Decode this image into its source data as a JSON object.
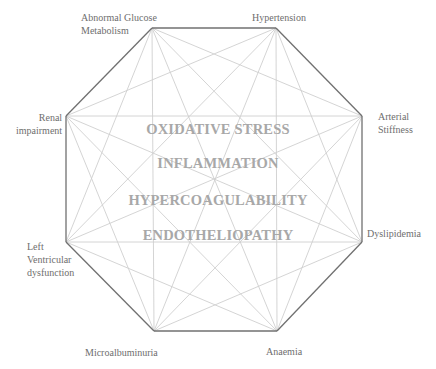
{
  "diagram": {
    "type": "complete-graph-octagon",
    "colors": {
      "edge": "#707070",
      "diagonal": "#cfcfcf",
      "node_label": "#6e6e6e",
      "center_label": "#a8a8a8"
    },
    "nodes": [
      {
        "id": "abnormal-glucose-metabolism",
        "label": "Abnormal Glucose\nMetabolism",
        "x": 152,
        "y": 28
      },
      {
        "id": "hypertension",
        "label": "Hypertension",
        "x": 276,
        "y": 28
      },
      {
        "id": "arterial-stiffness",
        "label": "Arterial\nStiffness",
        "x": 362,
        "y": 116
      },
      {
        "id": "dyslipidemia",
        "label": "Dyslipidemia",
        "x": 362,
        "y": 242
      },
      {
        "id": "anaemia",
        "label": "Anaemia",
        "x": 277,
        "y": 331
      },
      {
        "id": "microalbuminuria",
        "label": "Microalbuminuria",
        "x": 154,
        "y": 331
      },
      {
        "id": "left-ventricular-dysfunction",
        "label": "Left\nVentricular\ndysfunction",
        "x": 66,
        "y": 242
      },
      {
        "id": "renal-impairment",
        "label": "Renal\nimpairment",
        "x": 66,
        "y": 116
      }
    ],
    "center_labels": [
      "OXIDATIVE STRESS",
      "INFLAMMATION",
      "HYPERCOAGULABILITY",
      "ENDOTHELIOPATHY"
    ]
  }
}
